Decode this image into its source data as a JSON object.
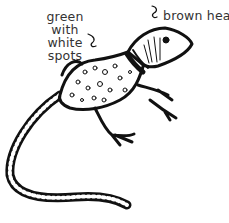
{
  "illustration": {
    "subject": "lizard",
    "labels": {
      "body_line1": "green with",
      "body_line2": "white",
      "body_line3": "spots",
      "head": "brown head"
    }
  }
}
